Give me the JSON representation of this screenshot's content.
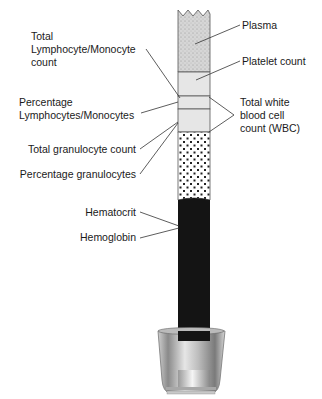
{
  "diagram": {
    "type": "blood-collection-tube-layers",
    "labels_left": {
      "total_lymph_mono": [
        "Total",
        "Lymphocyte/Monocyte",
        "count"
      ],
      "pct_lymph_mono": [
        "Percentage",
        "Lymphocytes/Monocytes"
      ],
      "total_granulocyte": "Total granulocyte count",
      "pct_granulocytes": "Percentage granulocytes",
      "hematocrit": "Hematocrit",
      "hemoglobin": "Hemoglobin"
    },
    "labels_right": {
      "plasma": "Plasma",
      "platelet": "Platelet count",
      "wbc": [
        "Total white",
        "blood cell",
        "count (WBC)"
      ]
    },
    "layers": [
      {
        "name": "plasma",
        "color": "#d9d9d9",
        "pattern": "fine-stipple"
      },
      {
        "name": "platelets",
        "color": "#e8e8e8"
      },
      {
        "name": "lymphocytes-monocytes",
        "color": "#e8e8e8"
      },
      {
        "name": "granulocytes",
        "color": "#ffffff",
        "pattern": "dots"
      },
      {
        "name": "red-blood-cells",
        "color": "#111111"
      }
    ]
  }
}
